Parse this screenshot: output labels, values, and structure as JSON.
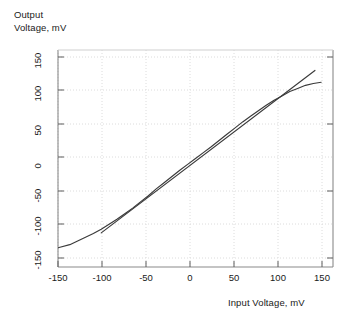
{
  "chart_data": {
    "type": "line",
    "title": "",
    "xlabel": "Input Voltage, mV",
    "ylabel_line1": "Output",
    "ylabel_line2": "Voltage, mV",
    "xlim": [
      -175,
      175
    ],
    "ylim": [
      -175,
      175
    ],
    "xticks": [
      -150,
      -100,
      -50,
      0,
      50,
      100,
      150
    ],
    "xtick_labels": [
      "-150",
      "-100",
      "-50",
      "0",
      "50",
      "100",
      "150"
    ],
    "yticks": [
      -150,
      -100,
      -50,
      0,
      50,
      100,
      150
    ],
    "ytick_labels": [
      "-150",
      "-100",
      "-50",
      "0",
      "50",
      "100",
      "150"
    ],
    "grid": true,
    "grid_style": "dotted",
    "grid_color": "#d8d8d8",
    "frame_color": "#8a8a8a",
    "legend": "none",
    "series": [
      {
        "name": "transfer-curve",
        "style": "solid",
        "color": "#3a3a3a",
        "x": [
          -175,
          -160,
          -150,
          -140,
          -130,
          -120,
          -110,
          -100,
          -90,
          -80,
          -70,
          -60,
          -50,
          -40,
          -30,
          -20,
          -10,
          0,
          10,
          20,
          30,
          40,
          50,
          60,
          70,
          80,
          90,
          100,
          110,
          120,
          130,
          140,
          150,
          160
        ],
        "y": [
          -144,
          -139,
          -133,
          -127,
          -121,
          -114,
          -106,
          -98,
          -89,
          -80,
          -70,
          -60,
          -49,
          -39,
          -29,
          -19,
          -9.5,
          0,
          9.5,
          19,
          29,
          39,
          49,
          59,
          68,
          77,
          86,
          94,
          101,
          108,
          113,
          118,
          121,
          123
        ]
      },
      {
        "name": "ideal-linear",
        "style": "solid",
        "color": "#3a3a3a",
        "x": [
          -120,
          152
        ],
        "y": [
          -120,
          142
        ]
      }
    ]
  },
  "axes": {
    "x_axis_name": "input-voltage-axis",
    "y_axis_name": "output-voltage-axis"
  }
}
